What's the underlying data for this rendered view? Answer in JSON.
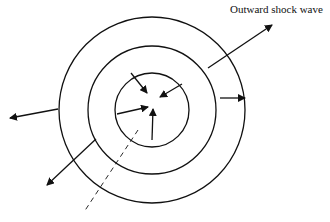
{
  "diagram": {
    "labels": {
      "outward_shock_wave": "Outward shock wave"
    },
    "center": [
      152,
      110
    ],
    "circles": [
      {
        "name": "outer",
        "r": 93
      },
      {
        "name": "middle",
        "r": 64
      },
      {
        "name": "inner",
        "r": 37
      }
    ],
    "arrows": {
      "outward": [
        {
          "from": [
            208,
            68
          ],
          "to": [
            272,
            25
          ]
        },
        {
          "from": [
            220,
            98
          ],
          "to": [
            245,
            98
          ]
        },
        {
          "from": [
            58,
            109
          ],
          "to": [
            10,
            118
          ]
        },
        {
          "from": [
            96,
            139
          ],
          "to": [
            47,
            185
          ]
        }
      ],
      "inward": [
        {
          "from": [
            131,
            73
          ],
          "to": [
            147,
            93
          ]
        },
        {
          "from": [
            182,
            84
          ],
          "to": [
            160,
            97
          ]
        },
        {
          "from": [
            117,
            114
          ],
          "to": [
            148,
            107
          ]
        },
        {
          "from": [
            152,
            140
          ],
          "to": [
            153,
            109
          ]
        }
      ]
    },
    "dashed_line": {
      "from": [
        138,
        130
      ],
      "to": [
        84,
        212
      ]
    },
    "stroke_color": "#111111"
  }
}
